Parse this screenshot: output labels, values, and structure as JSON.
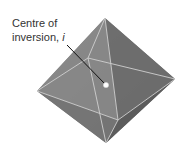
{
  "diagram": {
    "label": {
      "line1": "Centre of",
      "line2": "inversion, ",
      "symbol": "i"
    },
    "colors": {
      "face_light": "#8a8a8a",
      "face_mid": "#6f6f6f",
      "face_dark": "#5a5a5a",
      "edge": "#c9c9c9",
      "leader": "#111111",
      "centre_dot": "#ffffff"
    },
    "shape": "octahedron"
  }
}
